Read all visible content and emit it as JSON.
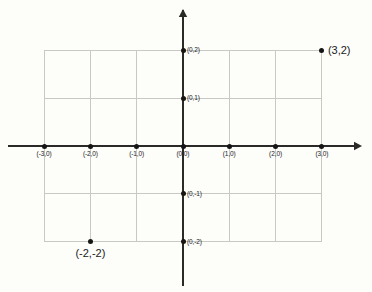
{
  "chart_data": {
    "type": "scatter",
    "title": "",
    "xlabel": "",
    "ylabel": "",
    "xlim": [
      -3,
      3
    ],
    "ylim": [
      -2,
      2
    ],
    "grid": true,
    "legend": null,
    "axis_arrows": {
      "x_positive": true,
      "y_positive": true
    },
    "points": [
      {
        "x": -3,
        "y": 0,
        "label": "(-3,0)",
        "label_style": "tick",
        "label_pos": "below-center"
      },
      {
        "x": -2,
        "y": 0,
        "label": "(-2,0)",
        "label_style": "tick",
        "label_pos": "below-center"
      },
      {
        "x": -1,
        "y": 0,
        "label": "(-1,0)",
        "label_style": "tick",
        "label_pos": "below-center"
      },
      {
        "x": 0,
        "y": 0,
        "label": "(0,0)",
        "label_style": "tick",
        "label_pos": "below-center"
      },
      {
        "x": 1,
        "y": 0,
        "label": "(1,0)",
        "label_style": "tick",
        "label_pos": "below-center"
      },
      {
        "x": 2,
        "y": 0,
        "label": "(2,0)",
        "label_style": "tick",
        "label_pos": "below-center"
      },
      {
        "x": 3,
        "y": 0,
        "label": "(3,0)",
        "label_style": "tick",
        "label_pos": "below-center"
      },
      {
        "x": 0,
        "y": 2,
        "label": "(0,2)",
        "label_style": "tick",
        "label_pos": "right"
      },
      {
        "x": 0,
        "y": 1,
        "label": "(0,1)",
        "label_style": "tick",
        "label_pos": "right"
      },
      {
        "x": 0,
        "y": -1,
        "label": "(0,-1)",
        "label_style": "tick",
        "label_pos": "right"
      },
      {
        "x": 0,
        "y": -2,
        "label": "(0,-2)",
        "label_style": "tick",
        "label_pos": "right"
      },
      {
        "x": 3,
        "y": 2,
        "label": "(3,2)",
        "label_style": "point",
        "label_pos": "right"
      },
      {
        "x": -2,
        "y": -2,
        "label": "(-2,-2)",
        "label_style": "point",
        "label_pos": "below-center"
      }
    ],
    "xticks": [
      -3,
      -2,
      -1,
      0,
      1,
      2,
      3
    ],
    "yticks": [
      -2,
      -1,
      0,
      1,
      2
    ],
    "colors": {
      "background": "#fdfdfa",
      "axis": "#2b2a28",
      "grid": "#c9c9c4",
      "point": "#151515",
      "text": "#1a1a1a"
    },
    "geometry": {
      "origin_x": 183,
      "origin_y": 146,
      "unit_x": 46.3,
      "unit_y": 47.8,
      "x_axis_left": 8,
      "x_axis_right": 360,
      "y_axis_top": 10,
      "y_axis_bottom": 286
    }
  }
}
